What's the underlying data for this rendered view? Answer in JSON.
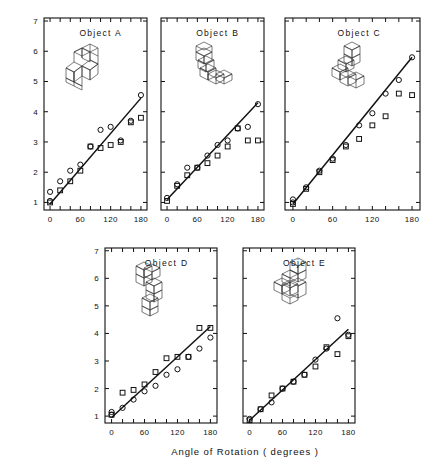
{
  "figure": {
    "axis_titles": {
      "y": "Mean Reaction Time for \"same\" Pairs ( seconds )",
      "x": "Angle of Rotation ( degrees )"
    },
    "panel_titles": {
      "a": "Object  A",
      "b": "Object  B",
      "c": "Object  C",
      "d": "Object  D",
      "e": "Object  E"
    },
    "y_ticks": [
      "1",
      "2",
      "3",
      "4",
      "5",
      "6",
      "7"
    ],
    "x_ticks": [
      "0",
      "60",
      "120",
      "180"
    ],
    "ink_color": "#111111"
  },
  "chart_data": {
    "type": "scatter",
    "title": "",
    "xlabel": "Angle of Rotation ( degrees )",
    "ylabel": "Mean Reaction Time for \"same\" Pairs ( seconds )",
    "xlim": [
      -12,
      192
    ],
    "ylim": [
      0.75,
      7.1
    ],
    "xticks": [
      0,
      60,
      120,
      180
    ],
    "xtick_minor_step": 20,
    "yticks": [
      1,
      2,
      3,
      4,
      5,
      6,
      7
    ],
    "grid": false,
    "legend": null,
    "marker_series": [
      "circle",
      "square"
    ],
    "panels": [
      {
        "id": "a",
        "label": "Object  A",
        "row": 0,
        "col": 0,
        "fit": {
          "intercept": 0.95,
          "slope_per_degree": 0.01944,
          "x_start": 0,
          "x_end": 180,
          "y_start": 0.95,
          "y_end": 4.45
        },
        "series": [
          {
            "name": "circle",
            "points": [
              [
                0,
                1.05
              ],
              [
                0,
                1.35
              ],
              [
                20,
                1.7
              ],
              [
                40,
                2.05
              ],
              [
                60,
                2.25
              ],
              [
                80,
                2.85
              ],
              [
                100,
                3.4
              ],
              [
                120,
                3.5
              ],
              [
                140,
                3.05
              ],
              [
                160,
                3.7
              ],
              [
                180,
                4.55
              ]
            ]
          },
          {
            "name": "square",
            "points": [
              [
                0,
                1.0
              ],
              [
                20,
                1.4
              ],
              [
                40,
                1.7
              ],
              [
                60,
                2.05
              ],
              [
                80,
                2.85
              ],
              [
                100,
                2.8
              ],
              [
                120,
                2.9
              ],
              [
                140,
                3.0
              ],
              [
                160,
                3.65
              ],
              [
                180,
                3.8
              ]
            ]
          }
        ]
      },
      {
        "id": "b",
        "label": "Object  B",
        "row": 0,
        "col": 1,
        "fit": {
          "intercept": 1.1,
          "slope_per_degree": 0.01778,
          "x_start": 0,
          "x_end": 180,
          "y_start": 1.1,
          "y_end": 4.3
        },
        "series": [
          {
            "name": "circle",
            "points": [
              [
                0,
                1.15
              ],
              [
                20,
                1.6
              ],
              [
                40,
                2.15
              ],
              [
                60,
                2.15
              ],
              [
                80,
                2.55
              ],
              [
                100,
                2.9
              ],
              [
                120,
                3.05
              ],
              [
                140,
                3.45
              ],
              [
                160,
                3.5
              ],
              [
                180,
                4.25
              ]
            ]
          },
          {
            "name": "square",
            "points": [
              [
                0,
                1.05
              ],
              [
                20,
                1.55
              ],
              [
                40,
                1.9
              ],
              [
                60,
                2.15
              ],
              [
                80,
                2.3
              ],
              [
                100,
                2.55
              ],
              [
                120,
                2.85
              ],
              [
                140,
                3.45
              ],
              [
                160,
                3.05
              ],
              [
                180,
                3.05
              ]
            ]
          }
        ]
      },
      {
        "id": "c",
        "label": "Object  C",
        "row": 0,
        "col": 2,
        "fit": {
          "intercept": 0.95,
          "slope_per_degree": 0.02694,
          "x_start": 0,
          "x_end": 180,
          "y_start": 0.95,
          "y_end": 5.8
        },
        "series": [
          {
            "name": "circle",
            "points": [
              [
                0,
                1.0
              ],
              [
                0,
                1.1
              ],
              [
                20,
                1.5
              ],
              [
                40,
                2.05
              ],
              [
                60,
                2.45
              ],
              [
                80,
                2.9
              ],
              [
                100,
                3.55
              ],
              [
                120,
                3.95
              ],
              [
                140,
                4.6
              ],
              [
                160,
                5.05
              ],
              [
                180,
                5.8
              ]
            ]
          },
          {
            "name": "square",
            "points": [
              [
                0,
                0.95
              ],
              [
                20,
                1.45
              ],
              [
                40,
                2.0
              ],
              [
                60,
                2.4
              ],
              [
                80,
                2.85
              ],
              [
                100,
                3.1
              ],
              [
                120,
                3.55
              ],
              [
                140,
                3.85
              ],
              [
                160,
                4.6
              ],
              [
                180,
                4.55
              ]
            ]
          }
        ]
      },
      {
        "id": "d",
        "label": "Object  D",
        "row": 1,
        "col": 0,
        "fit": {
          "intercept": 0.95,
          "slope_per_degree": 0.01833,
          "x_start": 0,
          "x_end": 180,
          "y_start": 0.95,
          "y_end": 4.25
        },
        "series": [
          {
            "name": "circle",
            "points": [
              [
                0,
                1.05
              ],
              [
                0,
                1.15
              ],
              [
                20,
                1.3
              ],
              [
                40,
                1.6
              ],
              [
                60,
                1.9
              ],
              [
                80,
                2.1
              ],
              [
                100,
                2.5
              ],
              [
                120,
                2.7
              ],
              [
                140,
                3.15
              ],
              [
                160,
                3.45
              ],
              [
                180,
                3.85
              ]
            ]
          },
          {
            "name": "square",
            "points": [
              [
                0,
                1.05
              ],
              [
                20,
                1.85
              ],
              [
                40,
                1.95
              ],
              [
                60,
                2.15
              ],
              [
                80,
                2.6
              ],
              [
                100,
                3.1
              ],
              [
                120,
                3.15
              ],
              [
                140,
                3.15
              ],
              [
                160,
                4.2
              ],
              [
                180,
                4.2
              ]
            ]
          }
        ]
      },
      {
        "id": "e",
        "label": "Object  E",
        "row": 1,
        "col": 1,
        "fit": {
          "intercept": 0.85,
          "slope_per_degree": 0.01833,
          "x_start": 0,
          "x_end": 180,
          "y_start": 0.85,
          "y_end": 4.15
        },
        "series": [
          {
            "name": "circle",
            "points": [
              [
                0,
                0.9
              ],
              [
                20,
                1.25
              ],
              [
                40,
                1.5
              ],
              [
                60,
                2.0
              ],
              [
                80,
                2.25
              ],
              [
                100,
                2.5
              ],
              [
                120,
                3.05
              ],
              [
                140,
                3.45
              ],
              [
                160,
                4.55
              ],
              [
                180,
                3.95
              ]
            ]
          },
          {
            "name": "square",
            "points": [
              [
                0,
                0.85
              ],
              [
                20,
                1.25
              ],
              [
                40,
                1.75
              ],
              [
                60,
                2.0
              ],
              [
                80,
                2.25
              ],
              [
                100,
                2.5
              ],
              [
                120,
                2.8
              ],
              [
                140,
                3.5
              ],
              [
                160,
                3.25
              ],
              [
                180,
                3.9
              ]
            ]
          }
        ]
      }
    ]
  }
}
